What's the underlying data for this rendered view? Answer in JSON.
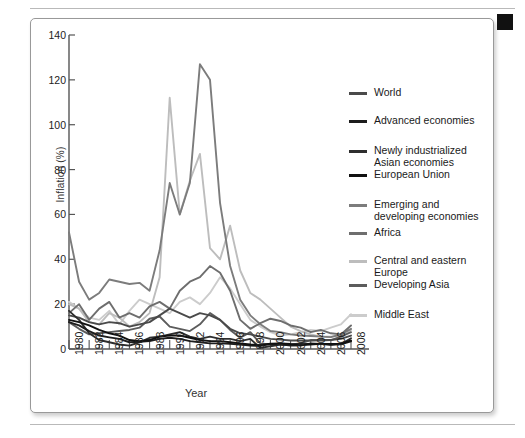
{
  "figure": {
    "corner_marker": "black-square-marker"
  },
  "chart_data": {
    "type": "line",
    "title": "",
    "xlabel": "Year",
    "ylabel": "Inflation (%)",
    "xlim": [
      1980,
      2008
    ],
    "ylim": [
      0,
      140
    ],
    "ytick_values": [
      0,
      20,
      40,
      60,
      80,
      100,
      120,
      140
    ],
    "xtick_values": [
      1980,
      1982,
      1984,
      1986,
      1988,
      1990,
      1992,
      1994,
      1996,
      1998,
      2000,
      2002,
      2004,
      2006,
      2008
    ],
    "xtick_labels": [
      "1980",
      "1982",
      "1984",
      "1986",
      "1988",
      "1990",
      "1992",
      "1994",
      "1996",
      "1998",
      "2000",
      "2002",
      "2004",
      "2006",
      "2008"
    ],
    "grid": false,
    "legend_position": "right",
    "x": [
      1980,
      1981,
      1982,
      1983,
      1984,
      1985,
      1986,
      1987,
      1988,
      1989,
      1990,
      1991,
      1992,
      1993,
      1994,
      1995,
      1996,
      1997,
      1998,
      1999,
      2000,
      2001,
      2002,
      2003,
      2004,
      2005,
      2006,
      2007,
      2008
    ],
    "series": [
      {
        "name": "World",
        "color": "#4a4a4a",
        "values": [
          15.0,
          14.0,
          12.0,
          11.0,
          12.0,
          11.5,
          10.0,
          11.0,
          12.0,
          15.0,
          18.0,
          16.0,
          14.0,
          16.0,
          15.0,
          13.0,
          9.0,
          7.0,
          6.5,
          5.5,
          4.5,
          4.2,
          3.8,
          3.8,
          3.8,
          4.0,
          4.0,
          4.5,
          6.0
        ]
      },
      {
        "name": "Advanced economies",
        "color": "#1d1d1d",
        "values": [
          12.0,
          10.5,
          8.0,
          6.0,
          5.2,
          4.5,
          3.0,
          3.2,
          3.5,
          4.5,
          5.0,
          4.5,
          3.5,
          3.0,
          2.5,
          2.5,
          2.3,
          2.0,
          1.5,
          1.4,
          2.2,
          2.1,
          1.5,
          1.8,
          2.0,
          2.3,
          2.3,
          2.1,
          3.4
        ]
      },
      {
        "name": "Newly industrialized Asian economies",
        "color": "#2e2e2e",
        "values": [
          17.0,
          13.0,
          7.0,
          4.0,
          3.0,
          2.0,
          1.5,
          3.0,
          5.0,
          5.5,
          6.5,
          7.5,
          5.5,
          4.5,
          5.5,
          4.5,
          4.5,
          3.5,
          4.5,
          0.5,
          1.2,
          2.0,
          1.8,
          1.5,
          2.5,
          2.3,
          1.8,
          2.2,
          4.8
        ]
      },
      {
        "name": "European Union",
        "color": "#111111",
        "values": [
          13.0,
          12.0,
          10.5,
          8.5,
          7.0,
          6.0,
          4.0,
          3.5,
          4.0,
          5.5,
          6.0,
          6.0,
          5.0,
          4.0,
          3.5,
          3.5,
          3.0,
          2.5,
          2.0,
          1.8,
          2.4,
          2.5,
          2.2,
          2.1,
          2.2,
          2.2,
          2.3,
          2.4,
          3.8
        ]
      },
      {
        "name": "Emerging and developing economies",
        "color": "#7c7c7c",
        "values": [
          52.0,
          30.0,
          22.0,
          25.0,
          31.0,
          30.0,
          29.0,
          29.5,
          26.0,
          44.0,
          74.0,
          60.0,
          74.0,
          127.0,
          120.0,
          65.0,
          37.0,
          22.0,
          15.0,
          11.0,
          8.0,
          7.5,
          6.5,
          6.0,
          5.8,
          5.5,
          5.3,
          6.5,
          9.0
        ]
      },
      {
        "name": "Africa",
        "color": "#6e6e6e",
        "values": [
          16.0,
          20.0,
          13.0,
          18.0,
          21.0,
          14.0,
          16.0,
          14.0,
          19.0,
          21.0,
          18.0,
          26.0,
          30.0,
          32.0,
          37.0,
          34.0,
          26.0,
          13.0,
          9.0,
          11.5,
          13.5,
          12.5,
          10.5,
          9.5,
          7.5,
          8.5,
          7.0,
          6.5,
          10.5
        ]
      },
      {
        "name": "Central and eastern Europe",
        "color": "#bdbdbd",
        "values": [
          20.0,
          18.0,
          12.0,
          11.0,
          16.0,
          14.0,
          10.0,
          12.0,
          16.0,
          32.0,
          112.0,
          60.0,
          75.0,
          87.0,
          45.0,
          40.0,
          55.0,
          35.0,
          25.0,
          22.0,
          18.0,
          14.0,
          10.0,
          8.0,
          6.5,
          5.5,
          5.5,
          6.0,
          8.5
        ]
      },
      {
        "name": "Developing Asia",
        "color": "#5c5c5c",
        "values": [
          12.0,
          9.0,
          6.5,
          7.0,
          7.5,
          8.0,
          8.5,
          9.5,
          13.5,
          14.5,
          10.0,
          9.0,
          8.0,
          11.0,
          16.0,
          13.0,
          8.5,
          5.0,
          7.5,
          2.5,
          2.0,
          2.5,
          2.0,
          2.5,
          4.0,
          3.8,
          4.0,
          5.5,
          7.5
        ]
      },
      {
        "name": "Middle East",
        "color": "#cccccc",
        "values": [
          21.0,
          18.0,
          14.0,
          13.0,
          17.0,
          11.0,
          17.0,
          22.0,
          20.0,
          18.0,
          16.0,
          21.0,
          23.0,
          20.0,
          25.0,
          32.0,
          27.0,
          20.0,
          13.0,
          10.0,
          7.5,
          6.0,
          6.5,
          7.5,
          8.5,
          8.0,
          9.5,
          11.0,
          15.5
        ]
      }
    ],
    "legend_entries": [
      {
        "label": "World",
        "color": "#4a4a4a"
      },
      {
        "label": "Advanced economies",
        "color": "#1d1d1d"
      },
      {
        "label": "Newly industrialized\nAsian economies",
        "color": "#2e2e2e"
      },
      {
        "label": "European Union",
        "color": "#111111"
      },
      {
        "label": "Emerging and\ndeveloping economies",
        "color": "#7c7c7c"
      },
      {
        "label": "Africa",
        "color": "#6e6e6e"
      },
      {
        "label": "Central and eastern\nEurope",
        "color": "#bdbdbd"
      },
      {
        "label": "Developing Asia",
        "color": "#5c5c5c"
      },
      {
        "label": "Middle East",
        "color": "#cccccc"
      }
    ]
  }
}
